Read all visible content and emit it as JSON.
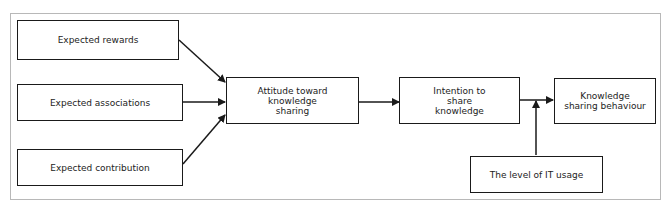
{
  "diagram": {
    "nodes": {
      "expected_rewards": "Expected rewards",
      "expected_associations": "Expected associations",
      "expected_contribution": "Expected contribution",
      "attitude": "Attitude toward knowledge sharing",
      "intention": "Intention to share knowledge",
      "behaviour": "Knowledge sharing behaviour",
      "it_usage": "The level of IT usage"
    },
    "edges": [
      {
        "from": "Expected rewards",
        "to": "Attitude toward knowledge sharing"
      },
      {
        "from": "Expected associations",
        "to": "Attitude toward knowledge sharing"
      },
      {
        "from": "Expected contribution",
        "to": "Attitude toward knowledge sharing"
      },
      {
        "from": "Attitude toward knowledge sharing",
        "to": "Intention to share knowledge"
      },
      {
        "from": "Intention to share knowledge",
        "to": "Knowledge sharing behaviour"
      },
      {
        "from": "The level of IT usage",
        "to": "Intention to share knowledge → Knowledge sharing behaviour (moderator)"
      }
    ],
    "colors": {
      "stroke": "#1a1a1a",
      "frame": "#b8b8b8",
      "background": "#ffffff"
    }
  }
}
